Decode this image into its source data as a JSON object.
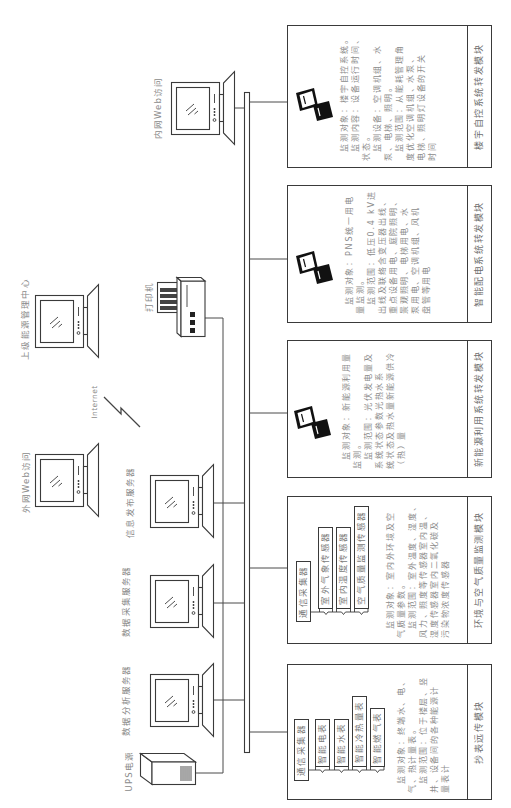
{
  "devices": {
    "ups": "UPS电源",
    "data_analysis_server": "数据分析服务器",
    "data_collection_server": "数据采集服务器",
    "info_publish_server": "信息发布服务器",
    "external_web_access": "外网Web访问",
    "internet": "Internet",
    "upper_energy_center": "上级能源管理中心",
    "printer": "打印机",
    "internal_web_access": "内网Web访问"
  },
  "modules": [
    {
      "title": "抄表远传模块",
      "collector": "通信采集器",
      "components": [
        "智能电表",
        "智能水表",
        "智能冷热量表",
        "智能燃气表"
      ],
      "description": [
        [
          "监测对象：终端水、电、",
          "气、热计量表。"
        ],
        [
          "监测范围：位于楼层、竖",
          "井、设备间的各种能源计",
          "量表计"
        ]
      ]
    },
    {
      "title": "环境与空气质量监测模块",
      "collector": "通信采集器",
      "components": [
        "室外气象传感器",
        "室内温度传感器",
        "空气质量监测传感器"
      ],
      "description": [
        [
          "监测对象：室内外环境及空",
          "气质量参数。"
        ],
        [
          "监测范围：室外温度、湿度、",
          "风力、照度等传感器室内温、",
          "湿度传感器室内二氧化碳及",
          "污染物浓度传感器"
        ]
      ]
    },
    {
      "title": "新能源利用系统转发模块",
      "icon": "workstation-icon",
      "description": [
        [
          "监测对象：新能源利用量",
          "监测。"
        ],
        [
          "监测范围：光伏发电量及",
          "系统状态参数光热水系",
          "统状态及热水量新能源供冷",
          "（热）量"
        ]
      ]
    },
    {
      "title": "智能配电系统转发模块",
      "icon": "workstation-icon",
      "description": [
        [
          "监测对象：PNS统一用电",
          "量监测。"
        ],
        [
          "监测范围：低压0.4 kV进",
          "出线及联络含变压器出线、",
          "重点设备用电、庭院照明、",
          "景观照明、电梯用电、水",
          "泵用电、空调机组、风机",
          "盘管等用电"
        ]
      ]
    },
    {
      "title": "楼宇自控系统转发模块",
      "icon": "workstation-icon",
      "description": [
        [
          "监测对象：楼宇自控系统。"
        ],
        [
          "监测内容：设备运行时间、",
          "状态。"
        ],
        [
          "监测设备：空调机组、水",
          "泵、电梯、照明。"
        ],
        [
          "监测范围：从能耗管理角",
          "度优化空调机组、水泵、",
          "电梯、照明灯设备的开关",
          "时间"
        ]
      ]
    }
  ]
}
